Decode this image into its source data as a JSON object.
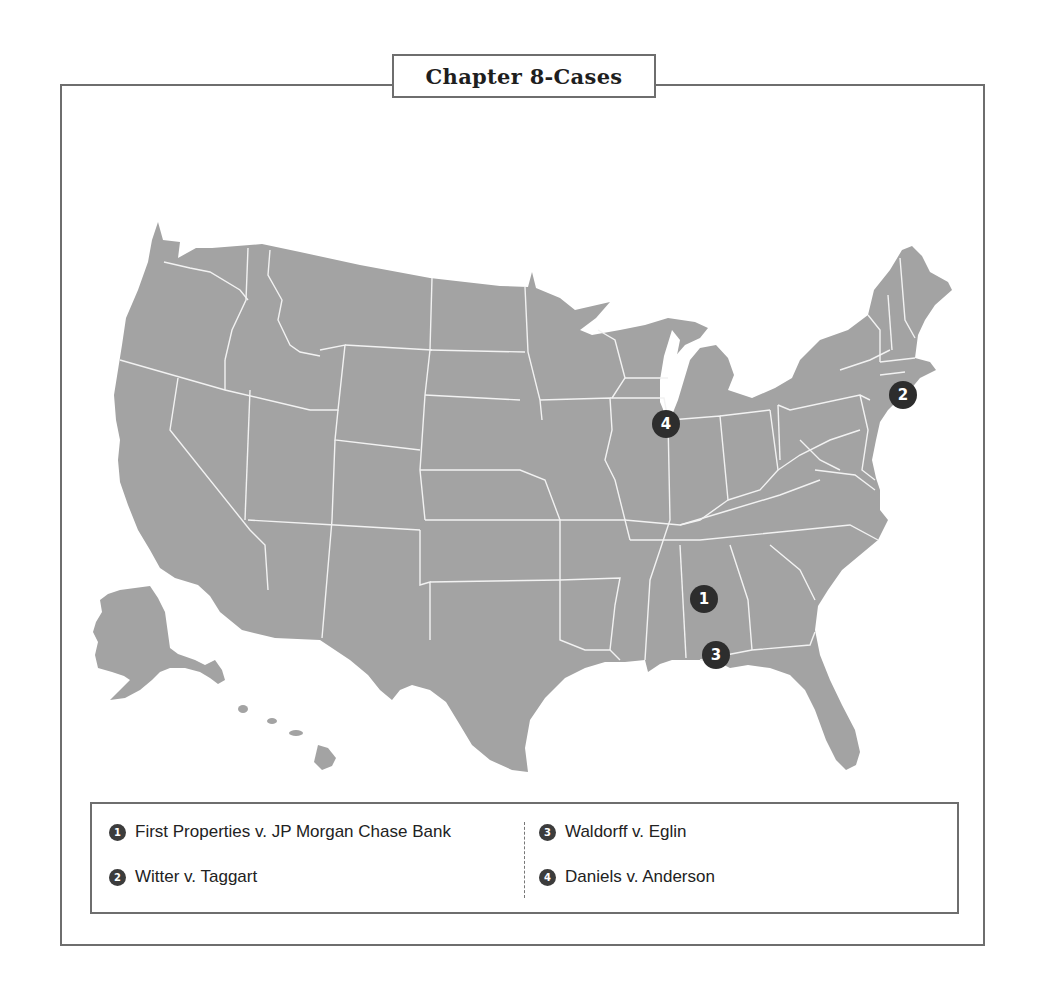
{
  "title": "Chapter 8-Cases",
  "colors": {
    "land": "#a3a3a3",
    "border": "#f2f2f2",
    "marker": "#2d2d2d",
    "frame": "#6e6e6e"
  },
  "markers": [
    {
      "number": "1",
      "x": 704,
      "y": 599,
      "state": "Alabama"
    },
    {
      "number": "2",
      "x": 903,
      "y": 395,
      "state": "Rhode Island / Connecticut coast"
    },
    {
      "number": "3",
      "x": 716,
      "y": 655,
      "state": "Alabama Gulf coast"
    },
    {
      "number": "4",
      "x": 666,
      "y": 424,
      "state": "Illinois"
    }
  ],
  "legend": {
    "items": [
      {
        "number": "1",
        "label": "First Properties v. JP Morgan Chase Bank"
      },
      {
        "number": "2",
        "label": "Witter v. Taggart"
      },
      {
        "number": "3",
        "label": "Waldorff v. Eglin"
      },
      {
        "number": "4",
        "label": "Daniels v. Anderson"
      }
    ]
  }
}
